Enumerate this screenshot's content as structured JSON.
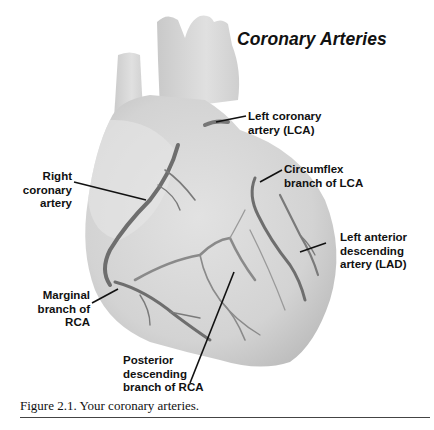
{
  "figure": {
    "title": "Coronary Arteries",
    "labels": {
      "lca": "Left coronary\nartery (LCA)",
      "circumflex": "Circumflex\nbranch of LCA",
      "lad": "Left anterior\ndescending\nartery (LAD)",
      "rca": "Right\ncoronary\nartery",
      "marginal": "Marginal\nbranch of\nRCA",
      "posterior": "Posterior\ndescending\nbranch of RCA"
    },
    "caption": "Figure 2.1. Your coronary arteries.",
    "colors": {
      "heart_fill": "#d9d9d9",
      "heart_shade": "#c4c4c4",
      "artery": "#6e6e6e",
      "artery_light": "#9a9a9a",
      "leader_line": "#111111",
      "text": "#111111"
    }
  }
}
